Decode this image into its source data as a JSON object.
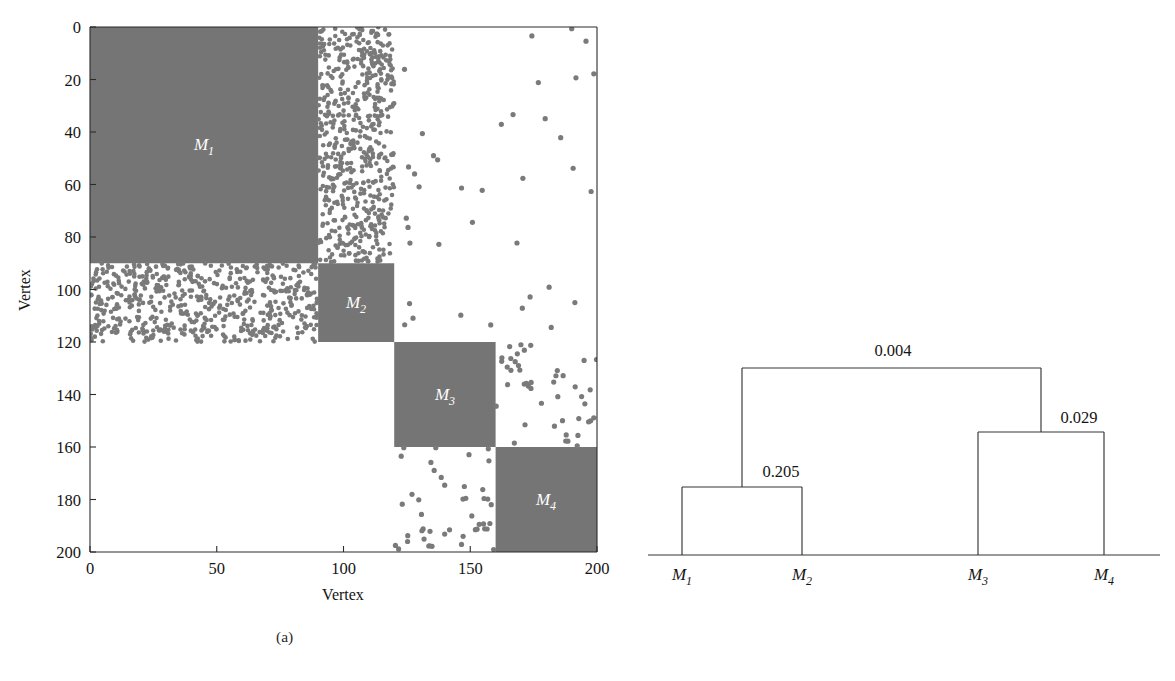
{
  "figure": {
    "subcaptions": {
      "a": "(a)",
      "b": "(b)"
    },
    "block_color": "#757575",
    "dot_color": "#7a7a7a",
    "line_color": "#35353a"
  },
  "panel_a": {
    "name": "adjacency-matrix",
    "x_axis_label": "Vertex",
    "y_axis_label": "Vertex",
    "x_ticks": [
      0,
      50,
      100,
      150,
      200
    ],
    "y_ticks": [
      0,
      20,
      40,
      60,
      80,
      100,
      120,
      140,
      160,
      180,
      200
    ],
    "x_range": [
      0,
      200
    ],
    "y_range": [
      0,
      200
    ],
    "block_labels": [
      "M",
      "M",
      "M",
      "M"
    ],
    "block_subscripts": [
      "1",
      "2",
      "3",
      "4"
    ]
  },
  "panel_b": {
    "name": "dendrogram",
    "leaf_labels": [
      "M",
      "M",
      "M",
      "M"
    ],
    "leaf_subscripts": [
      "1",
      "2",
      "3",
      "4"
    ],
    "merge_labels": [
      "0.205",
      "0.029",
      "0.004"
    ]
  },
  "chart_data": [
    {
      "type": "heatmap",
      "title": "",
      "panel": "(a)",
      "xlabel": "Vertex",
      "ylabel": "Vertex",
      "xlim": [
        0,
        200
      ],
      "ylim": [
        200,
        0
      ],
      "xticks": [
        0,
        50,
        100,
        150,
        200
      ],
      "yticks": [
        0,
        20,
        40,
        60,
        80,
        100,
        120,
        140,
        160,
        180,
        200
      ],
      "grid": false,
      "legend": "none",
      "description": "Block-structured adjacency matrix of a 200-vertex network with four modules shown as solid gray diagonal blocks; off-diagonal inter-module edges shown as sparse gray dots.",
      "modules": [
        {
          "label": "M1",
          "start": 0,
          "end": 90,
          "size": 90,
          "diagonal_fill": "solid"
        },
        {
          "label": "M2",
          "start": 90,
          "end": 120,
          "size": 30,
          "diagonal_fill": "solid"
        },
        {
          "label": "M3",
          "start": 120,
          "end": 160,
          "size": 40,
          "diagonal_fill": "solid"
        },
        {
          "label": "M4",
          "start": 160,
          "end": 200,
          "size": 40,
          "diagonal_fill": "solid"
        }
      ],
      "offdiagonal_density": [
        {
          "row_module": "M1",
          "col_module": "M2",
          "density": 0.55
        },
        {
          "row_module": "M2",
          "col_module": "M1",
          "density": 0.55
        },
        {
          "row_module": "M1",
          "col_module": "M3",
          "density": 0.01
        },
        {
          "row_module": "M1",
          "col_module": "M4",
          "density": 0.01
        },
        {
          "row_module": "M2",
          "col_module": "M3",
          "density": 0.01
        },
        {
          "row_module": "M2",
          "col_module": "M4",
          "density": 0.01
        },
        {
          "row_module": "M3",
          "col_module": "M4",
          "density": 0.07
        },
        {
          "row_module": "M4",
          "col_module": "M3",
          "density": 0.07
        }
      ]
    },
    {
      "type": "dendrogram",
      "panel": "(b)",
      "title": "",
      "xlabel": "",
      "ylabel": "",
      "grid": false,
      "legend": "none",
      "description": "Hierarchical merge tree of the four modules with merge heights annotated.",
      "leaves": [
        "M1",
        "M2",
        "M3",
        "M4"
      ],
      "merges": [
        {
          "label": "0.205",
          "children": [
            "M1",
            "M2"
          ],
          "height": 0.205,
          "height_px_rank": 1
        },
        {
          "label": "0.029",
          "children": [
            "M3",
            "M4"
          ],
          "height": 0.029,
          "height_px_rank": 2
        },
        {
          "label": "0.004",
          "children": [
            "M1+M2",
            "M3+M4"
          ],
          "height": 0.004,
          "height_px_rank": 3
        }
      ]
    }
  ]
}
